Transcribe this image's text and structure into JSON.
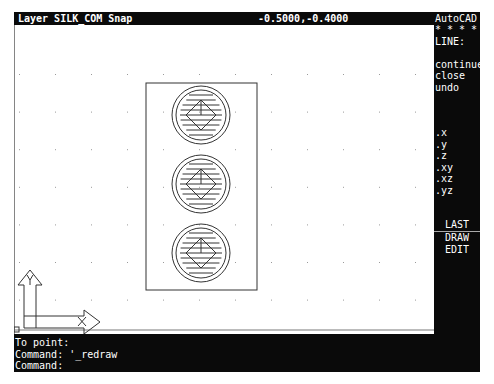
{
  "app": {
    "title": "AutoCAD"
  },
  "status_bar": {
    "layer_snap": "Layer SILK_COM Snap",
    "coordinates": "-0.5000,-0.4000"
  },
  "side_menu": {
    "title": "AutoCAD",
    "stars": "* * * *",
    "command": "LINE:",
    "options": [
      "continue",
      "close",
      "undo"
    ],
    "filters": [
      ".x",
      ".y",
      ".z",
      ".xy",
      ".xz",
      ".yz"
    ],
    "nav": [
      "LAST",
      "DRAW",
      "EDIT"
    ]
  },
  "command_area": {
    "lines": [
      "To point:",
      "Command: '_redraw",
      "Command:"
    ]
  },
  "drawing": {
    "ucs_icon": {
      "x_label": "X",
      "y_label": "Y"
    },
    "outline": {
      "x": 132,
      "y": 58,
      "w": 111,
      "h": 207
    },
    "pads": [
      {
        "cx": 187,
        "cy": 90
      },
      {
        "cx": 187,
        "cy": 159
      },
      {
        "cx": 187,
        "cy": 228
      }
    ],
    "pad_outer_r": 29,
    "pad_inner_r": 25,
    "grid": {
      "x0": 5,
      "dx": 36,
      "y0": 49,
      "dy": 37.6
    },
    "colors": {
      "line": "#333333",
      "grid": "#9a9a9a",
      "background": "#ffffff",
      "panel": "#0a0a0a",
      "text": "#ffffff"
    }
  }
}
